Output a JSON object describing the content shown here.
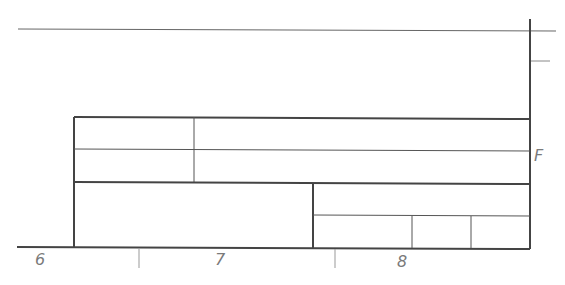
{
  "drawing": {
    "type": "engineering drawing title block",
    "zone_labels": {
      "bottom": [
        "6",
        "7",
        "8"
      ],
      "right": [
        "F"
      ]
    },
    "colors": {
      "line": "#444444",
      "thin_line": "#666666",
      "label": "#7a7a7a",
      "background": "#ffffff"
    }
  }
}
